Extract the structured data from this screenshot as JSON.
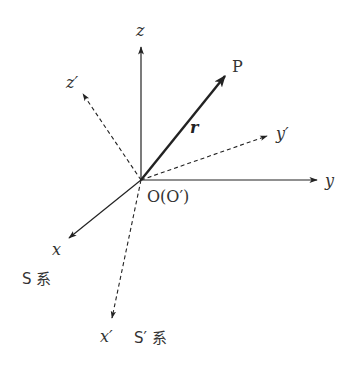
{
  "diagram": {
    "origin": {
      "label": "O(O′)",
      "x": 141,
      "y": 180
    },
    "colors": {
      "line": "#222222",
      "text": "#333333",
      "background": "#ffffff"
    },
    "frames": [
      {
        "name": "S系",
        "label": "S 系",
        "style": "solid",
        "axes": [
          {
            "id": "x",
            "label": "x",
            "tip": [
              68,
              239
            ],
            "label_pos": [
              54,
              254
            ]
          },
          {
            "id": "y",
            "label": "y",
            "tip": [
              318,
              180
            ],
            "label_pos": [
              325,
              186
            ]
          },
          {
            "id": "z",
            "label": "z",
            "tip": [
              141,
              46
            ],
            "label_pos": [
              136,
              36
            ]
          }
        ]
      },
      {
        "name": "S′系",
        "label": "S′ 系",
        "style": "dashed",
        "axes": [
          {
            "id": "x'",
            "label": "x′",
            "tip": [
              112,
              319
            ],
            "label_pos": [
              100,
              342
            ]
          },
          {
            "id": "y'",
            "label": "y′",
            "tip": [
              268,
              136
            ],
            "label_pos": [
              276,
              139
            ]
          },
          {
            "id": "z'",
            "label": "z′",
            "tip": [
              82,
              93
            ],
            "label_pos": [
              67,
              88
            ]
          }
        ]
      }
    ],
    "vector": {
      "label": "r",
      "point_label": "P",
      "tip": [
        226,
        75
      ],
      "label_pos": [
        192,
        132
      ],
      "point_label_pos": [
        233,
        72
      ]
    },
    "frame_labels": {
      "S": {
        "text": "S 系",
        "pos": [
          22,
          284
        ]
      },
      "S_prime": {
        "text": "S′ 系",
        "pos": [
          134,
          343
        ]
      }
    }
  }
}
